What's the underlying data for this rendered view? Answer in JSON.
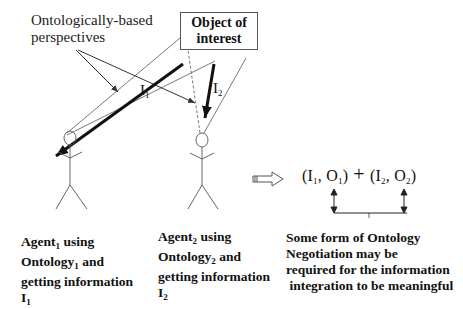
{
  "labels": {
    "perspectives": [
      "Ontologically-based",
      "perspectives"
    ],
    "object_of_interest": [
      "Object of",
      "interest"
    ],
    "i1": {
      "base": "I",
      "sub": "1"
    },
    "i2": {
      "base": "I",
      "sub": "2"
    }
  },
  "agent1": {
    "line1_base": "Agent",
    "line1_sub": "1",
    "line1_rest": " using",
    "line2_base": "Ontology",
    "line2_sub": "1",
    "line2_rest": " and",
    "line3": "getting information",
    "line4_base": "I",
    "line4_sub": "1"
  },
  "agent2": {
    "line1_base": "Agent",
    "line1_sub": "2",
    "line1_rest": " using",
    "line2_base": "Ontology",
    "line2_sub": "2",
    "line2_rest": " and",
    "line3": "getting information",
    "line4_base": "I",
    "line4_sub": "2"
  },
  "formula": {
    "open1": "(I",
    "s1": "1",
    "mid1": ", O",
    "s2": "1",
    "close1": ")",
    "plus": " + ",
    "open2": "(I",
    "s3": "2",
    "mid2": ", O",
    "s4": "2",
    "close2": ")"
  },
  "negotiation": [
    "Some form of Ontology",
    "Negotiation may be",
    "required for the information",
    " integration to be meaningful"
  ],
  "icons": [
    "stick-figure-agent",
    "implies-arrow",
    "double-headed-arrow"
  ]
}
